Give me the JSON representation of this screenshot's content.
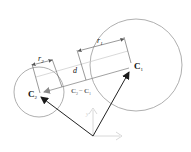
{
  "diagram": {
    "type": "geometry",
    "labels": {
      "c1": "C",
      "c1_sub": "1",
      "c2": "C",
      "c2_sub": "2",
      "r1": "r",
      "r1_sub": "1",
      "r2": "r",
      "r2_sub": "2",
      "d": "d",
      "diff_a": "C",
      "diff_a_sub": "2",
      "diff_op": "−",
      "diff_b": "C",
      "diff_b_sub": "1",
      "axis_y": "y"
    },
    "colors": {
      "circle": "#9a9a9a",
      "arrow": "#222222",
      "dim": "#555555",
      "gray_arrow": "#8a8a8a",
      "axis": "#d0d0d0",
      "text": "#111111"
    },
    "circles": [
      {
        "name": "circle-1",
        "cx": 136,
        "cy": 65,
        "r": 46
      },
      {
        "name": "circle-2",
        "cx": 39,
        "cy": 92,
        "r": 25
      }
    ]
  }
}
